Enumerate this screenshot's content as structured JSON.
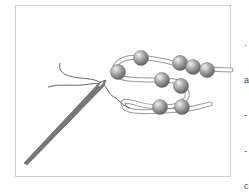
{
  "illustration": {
    "subject": "needle threading a beaded loop",
    "frame_color": "#cfcfcf",
    "bead_color": "#9a9a9a",
    "needle_color": "#6f6f6f",
    "thread_color": "#555555"
  },
  "edge_text": {
    "fragments": [
      "·",
      "a",
      "-",
      "-",
      "c",
      "s",
      "a",
      "i",
      "e",
      "l",
      "c",
      "i"
    ]
  }
}
